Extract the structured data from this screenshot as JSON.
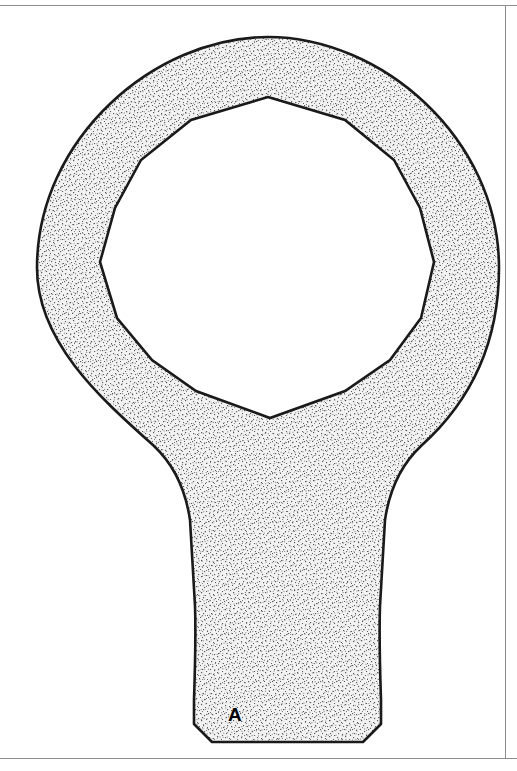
{
  "drawing": {
    "title": "Box-end wrench head outline drawing",
    "background_color": "#ffffff",
    "line_color": "#000000",
    "fill_color": "#e9e9e9",
    "stipple_dot_color": "#4a4a4a",
    "sheet_border_color": "#8d8d8d",
    "canvas": {
      "width": 517,
      "height": 771
    }
  },
  "labels": {
    "part_a": "A"
  },
  "geometry": {
    "ring": {
      "shape": "annulus",
      "center_x": 268,
      "center_y": 268,
      "outer_radius": 231,
      "description": "outer circular boss of the wrench head"
    },
    "opening": {
      "shape": "twelve-point-polygon",
      "vertex_top_x": 268,
      "vertex_top_y": 97,
      "vertex_left_x": 100,
      "vertex_left_y": 262,
      "vertex_right_x": 434,
      "vertex_right_y": 262,
      "vertex_bottom_x": 270,
      "vertex_bottom_y": 418,
      "description": "twelve-point box-end socket opening"
    },
    "shank": {
      "shape": "tapered-neck",
      "top_width": 330,
      "waist_width": 112,
      "bottom_width": 112,
      "bottom_y": 742,
      "chamfer": 18,
      "description": "tapered handle neck with chamfered end"
    }
  },
  "sheet": {
    "rule_top_y": 5,
    "rule_bottom_y": 758,
    "rule_right_x": 505
  }
}
